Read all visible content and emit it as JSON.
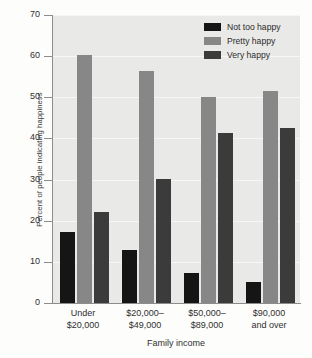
{
  "chart_data": {
    "type": "bar",
    "title": "",
    "xlabel": "Family income",
    "ylabel": "Percent of people indicating happiness",
    "categories": [
      "Under\n$20,000",
      "$20,000–\n$49,000",
      "$50,000–\n$89,000",
      "$90,000\nand over"
    ],
    "category_lines": [
      [
        "Under",
        "$20,000"
      ],
      [
        "$20,000–",
        "$49,000"
      ],
      [
        "$50,000–",
        "$89,000"
      ],
      [
        "$90,000",
        "and over"
      ]
    ],
    "series": [
      {
        "name": "Not too happy",
        "color": "#151515",
        "values": [
          17.2,
          12.8,
          7.2,
          5.0
        ]
      },
      {
        "name": "Pretty happy",
        "color": "#878787",
        "values": [
          60.3,
          56.5,
          50.0,
          51.5
        ]
      },
      {
        "name": "Very happy",
        "color": "#3b3b3b",
        "values": [
          22.2,
          30.1,
          41.4,
          42.6
        ]
      }
    ],
    "ylim": [
      0,
      70
    ],
    "yticks": [
      0,
      10,
      20,
      30,
      40,
      50,
      60,
      70
    ],
    "ytick_labels": [
      "0",
      "10",
      "20",
      "30",
      "40",
      "50",
      "60",
      "70"
    ],
    "grid": true,
    "legend_position": "top-right",
    "plot_background": "#e9e9e7"
  },
  "legend": {
    "entries": [
      {
        "label": "Not too happy"
      },
      {
        "label": "Pretty happy"
      },
      {
        "label": "Very happy"
      }
    ]
  }
}
